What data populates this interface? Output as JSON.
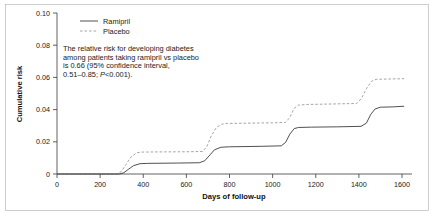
{
  "chart_data": {
    "type": "line",
    "title": "",
    "xlabel": "Days of follow-up",
    "ylabel": "Cumulative risk",
    "xlim": [
      0,
      1600
    ],
    "ylim": [
      0,
      0.1
    ],
    "grid": false,
    "legend_position": "top-left",
    "xticks": [
      0,
      200,
      400,
      600,
      800,
      1000,
      1200,
      1400,
      1600
    ],
    "xtick_labels": [
      "0",
      "200",
      "400",
      "600",
      "800",
      "1000",
      "1200",
      "1400",
      "1600"
    ],
    "yticks": [
      0,
      0.02,
      0.04,
      0.06,
      0.08,
      0.1
    ],
    "ytick_labels": [
      "0",
      "0.02",
      "0.04",
      "0.06",
      "0.08",
      "0.10"
    ],
    "series": [
      {
        "name": "Ramipril",
        "style": "solid",
        "color": "#3c3c3c",
        "points": [
          [
            0,
            0.0
          ],
          [
            290,
            0.0
          ],
          [
            310,
            0.0008
          ],
          [
            330,
            0.0028
          ],
          [
            355,
            0.0052
          ],
          [
            385,
            0.0064
          ],
          [
            420,
            0.0066
          ],
          [
            560,
            0.0068
          ],
          [
            660,
            0.007
          ],
          [
            685,
            0.0082
          ],
          [
            705,
            0.0112
          ],
          [
            730,
            0.015
          ],
          [
            760,
            0.0166
          ],
          [
            800,
            0.0169
          ],
          [
            950,
            0.0172
          ],
          [
            1040,
            0.0175
          ],
          [
            1060,
            0.0196
          ],
          [
            1080,
            0.0248
          ],
          [
            1100,
            0.0282
          ],
          [
            1120,
            0.0289
          ],
          [
            1180,
            0.0291
          ],
          [
            1300,
            0.0293
          ],
          [
            1410,
            0.0296
          ],
          [
            1435,
            0.0316
          ],
          [
            1455,
            0.037
          ],
          [
            1475,
            0.0404
          ],
          [
            1500,
            0.0415
          ],
          [
            1560,
            0.0417
          ],
          [
            1610,
            0.0421
          ]
        ]
      },
      {
        "name": "Placebo",
        "style": "dashed",
        "color": "#9a9a9a",
        "points": [
          [
            0,
            0.0
          ],
          [
            280,
            0.0
          ],
          [
            300,
            0.0018
          ],
          [
            320,
            0.006
          ],
          [
            345,
            0.0108
          ],
          [
            370,
            0.0132
          ],
          [
            390,
            0.0136
          ],
          [
            450,
            0.0137
          ],
          [
            600,
            0.0138
          ],
          [
            675,
            0.014
          ],
          [
            695,
            0.017
          ],
          [
            715,
            0.0236
          ],
          [
            740,
            0.029
          ],
          [
            765,
            0.031
          ],
          [
            790,
            0.0314
          ],
          [
            900,
            0.0316
          ],
          [
            1000,
            0.0318
          ],
          [
            1060,
            0.032
          ],
          [
            1080,
            0.0352
          ],
          [
            1100,
            0.0408
          ],
          [
            1120,
            0.0428
          ],
          [
            1160,
            0.0432
          ],
          [
            1280,
            0.0435
          ],
          [
            1390,
            0.0438
          ],
          [
            1412,
            0.047
          ],
          [
            1435,
            0.053
          ],
          [
            1458,
            0.0575
          ],
          [
            1480,
            0.0588
          ],
          [
            1540,
            0.059
          ],
          [
            1610,
            0.0592
          ]
        ]
      }
    ],
    "annotation": {
      "lines": [
        "The relative risk for developing diabetes",
        "among patients taking ramipril vs placebo",
        "is 0.66 (95% confidence interval,"
      ],
      "last_line_prefix": "0.51–0.85; ",
      "last_line_italic": "P",
      "last_line_suffix": "<0.001)."
    }
  },
  "legend": {
    "items": [
      {
        "label": "Ramipril"
      },
      {
        "label": "Placebo"
      }
    ]
  },
  "icons": {
    "legend_solid": "solid-line-swatch-icon",
    "legend_dashed": "dashed-line-swatch-icon"
  }
}
